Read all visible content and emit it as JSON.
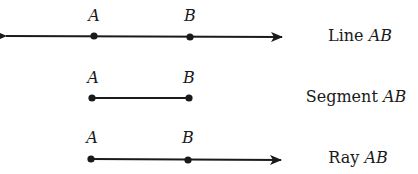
{
  "diagram": {
    "line": {
      "point_a": "A",
      "point_b": "B",
      "caption_word": "Line",
      "caption_name": "AB"
    },
    "segment": {
      "point_a": "A",
      "point_b": "B",
      "caption_word": "Segment",
      "caption_name": "AB"
    },
    "ray": {
      "point_a": "A",
      "point_b": "B",
      "caption_word": "Ray",
      "caption_name": "AB"
    },
    "stroke_color": "#1a1a1a"
  }
}
